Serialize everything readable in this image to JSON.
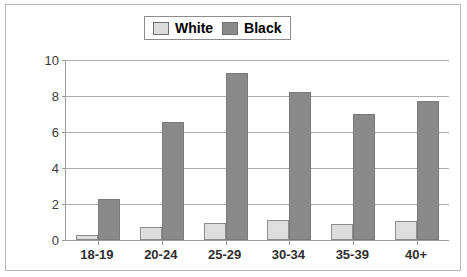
{
  "chart_data": {
    "type": "bar",
    "title": "",
    "xlabel": "",
    "ylabel": "",
    "categories": [
      "18-19",
      "20-24",
      "25-29",
      "30-34",
      "35-39",
      "40+"
    ],
    "series": [
      {
        "name": "White",
        "color": "#dedede",
        "values": [
          0.3,
          0.7,
          0.95,
          1.1,
          0.9,
          1.05
        ]
      },
      {
        "name": "Black",
        "color": "#8a8a8a",
        "values": [
          2.3,
          6.55,
          9.3,
          8.25,
          7.0,
          7.75
        ]
      }
    ],
    "ylim": [
      0,
      10
    ],
    "yticks": [
      0,
      2,
      4,
      6,
      8,
      10
    ],
    "ytick_labels": [
      "0",
      "2",
      "4",
      "6",
      "8",
      "10"
    ],
    "grid": "horizontal",
    "legend_position": "top-center",
    "legend_entries": [
      "White",
      "Black"
    ]
  }
}
